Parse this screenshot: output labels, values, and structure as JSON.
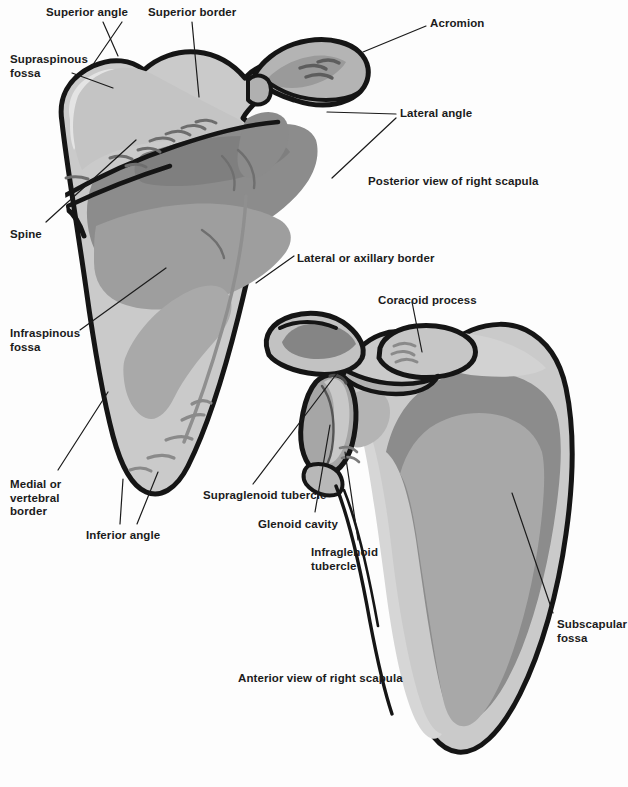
{
  "figure": {
    "width": 628,
    "height": 787,
    "background_color": "#fdfdfd"
  },
  "palette": {
    "outline": "#151515",
    "bone_light": "#cccccc",
    "bone_mid": "#a6a6a6",
    "bone_dark": "#868686",
    "bone_pale": "#e0e0e0",
    "leader_line": "#1b1b1b",
    "text": "#1b1b1b"
  },
  "captions": [
    {
      "id": "posterior",
      "text": "Posterior view of right scapula",
      "x": 368,
      "y": 175
    },
    {
      "id": "anterior",
      "text": "Anterior view of right scapula",
      "x": 238,
      "y": 672
    }
  ],
  "labels": [
    {
      "id": "superior-angle",
      "text": "Superior angle",
      "x": 46,
      "y": 6,
      "align": "left",
      "lines": 1
    },
    {
      "id": "superior-border",
      "text": "Superior border",
      "x": 148,
      "y": 6,
      "align": "left",
      "lines": 1
    },
    {
      "id": "acromion",
      "text": "Acromion",
      "x": 430,
      "y": 17,
      "align": "left",
      "lines": 1
    },
    {
      "id": "supraspinous-fossa",
      "text": "Supraspinous\nfossa",
      "x": 10,
      "y": 53,
      "align": "left",
      "lines": 2
    },
    {
      "id": "lateral-angle",
      "text": "Lateral angle",
      "x": 400,
      "y": 107,
      "align": "left",
      "lines": 1
    },
    {
      "id": "spine",
      "text": "Spine",
      "x": 10,
      "y": 228,
      "align": "left",
      "lines": 1
    },
    {
      "id": "lateral-axillary-border",
      "text": "Lateral or axillary border",
      "x": 297,
      "y": 252,
      "align": "left",
      "lines": 1
    },
    {
      "id": "infraspinous-fossa",
      "text": "Infraspinous\nfossa",
      "x": 10,
      "y": 327,
      "align": "left",
      "lines": 2
    },
    {
      "id": "coracoid-process",
      "text": "Coracoid process",
      "x": 378,
      "y": 294,
      "align": "left",
      "lines": 1
    },
    {
      "id": "medial-vertebral-border",
      "text": "Medial or\nvertebral\nborder",
      "x": 10,
      "y": 478,
      "align": "left",
      "lines": 3
    },
    {
      "id": "supraglenoid-tubercle",
      "text": "Supraglenoid tubercle",
      "x": 203,
      "y": 489,
      "align": "left",
      "lines": 1
    },
    {
      "id": "inferior-angle",
      "text": "Inferior angle",
      "x": 86,
      "y": 529,
      "align": "left",
      "lines": 1
    },
    {
      "id": "glenoid-cavity",
      "text": "Glenoid cavity",
      "x": 258,
      "y": 518,
      "align": "left",
      "lines": 1
    },
    {
      "id": "infraglenoid-tubercle",
      "text": "Infraglenoid\ntubercle",
      "x": 311,
      "y": 546,
      "align": "left",
      "lines": 2
    },
    {
      "id": "subscapular-fossa",
      "text": "Subscapular\nfossa",
      "x": 557,
      "y": 618,
      "align": "left",
      "lines": 2
    }
  ],
  "leaders": [
    {
      "id": "superior-angle-a",
      "points": "103,22 118,56"
    },
    {
      "id": "superior-angle-b",
      "points": "122,22 92,66"
    },
    {
      "id": "superior-border",
      "points": "192,22 199,97"
    },
    {
      "id": "acromion",
      "points": "426,26 363,52"
    },
    {
      "id": "supraspinous-fossa",
      "points": "72,73 113,88"
    },
    {
      "id": "lateral-angle-a",
      "points": "396,114 327,112"
    },
    {
      "id": "lateral-angle-b",
      "points": "396,118 332,178"
    },
    {
      "id": "spine",
      "points": "46,222 136,140"
    },
    {
      "id": "lateral-axillary-border",
      "points": "294,256 256,283"
    },
    {
      "id": "infraspinous-fossa",
      "points": "80,330 166,268"
    },
    {
      "id": "coracoid-process",
      "points": "412,302 422,352"
    },
    {
      "id": "medial-vertebral-border",
      "points": "58,470 108,392"
    },
    {
      "id": "supraglenoid-tubercle",
      "points": "253,484 338,372"
    },
    {
      "id": "inferior-angle-a",
      "points": "120,524 123,479"
    },
    {
      "id": "inferior-angle-b",
      "points": "137,524 158,472"
    },
    {
      "id": "glenoid-cavity",
      "points": "315,512 330,425"
    },
    {
      "id": "infraglenoid-tubercle",
      "points": "358,540 345,452"
    },
    {
      "id": "subscapular-fossa",
      "points": "553,613 512,493"
    }
  ],
  "views": [
    {
      "id": "posterior-scapula",
      "name": "posterior-view-scapula",
      "features": [
        "superior angle",
        "superior border",
        "supraspinous fossa",
        "spine",
        "acromion",
        "lateral angle",
        "infraspinous fossa",
        "lateral or axillary border",
        "medial or vertebral border",
        "inferior angle"
      ]
    },
    {
      "id": "anterior-scapula",
      "name": "anterior-view-scapula",
      "features": [
        "coracoid process",
        "supraglenoid tubercle",
        "glenoid cavity",
        "infraglenoid tubercle",
        "subscapular fossa"
      ]
    }
  ]
}
